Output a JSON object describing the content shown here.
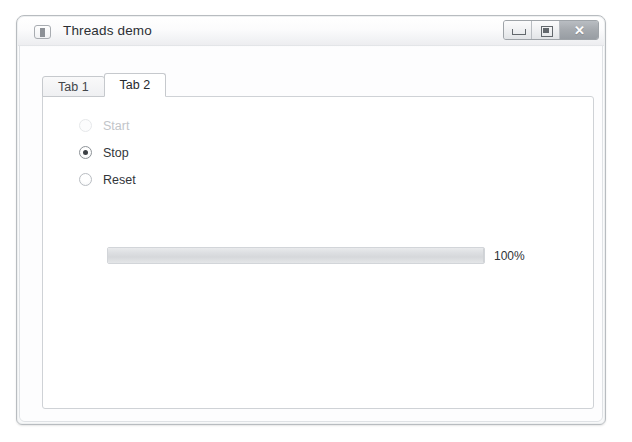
{
  "window": {
    "title": "Threads demo",
    "icon": "app-window-icon",
    "controls": {
      "minimize": {
        "icon": "minimize-icon",
        "label": "Minimize"
      },
      "maximize": {
        "icon": "maximize-icon",
        "label": "Maximize"
      },
      "close": {
        "icon": "close-icon",
        "glyph": "✕",
        "label": "Close"
      }
    }
  },
  "tabs": [
    {
      "label": "Tab 1",
      "active": false
    },
    {
      "label": "Tab 2",
      "active": true
    }
  ],
  "radio_group": {
    "name": "thread-control",
    "options": [
      {
        "label": "Start",
        "checked": false,
        "disabled": true
      },
      {
        "label": "Stop",
        "checked": true,
        "disabled": false
      },
      {
        "label": "Reset",
        "checked": false,
        "disabled": false
      }
    ],
    "selected": "Stop"
  },
  "progress": {
    "percent": 100,
    "label": "100%",
    "min": 0,
    "max": 100
  },
  "colors": {
    "window_border": "#b8bcc0",
    "titlebar_top": "#ffffff",
    "titlebar_bottom": "#ededf0",
    "close_button": "#a7abb0",
    "panel_background": "#ffffff",
    "panel_border": "#cfd2d6",
    "text": "#32363a",
    "text_disabled": "#c2c5c9",
    "radio_dot": "#3c4044",
    "progress_fill": "#dcdee1",
    "desktop_background": "#ffffff"
  }
}
